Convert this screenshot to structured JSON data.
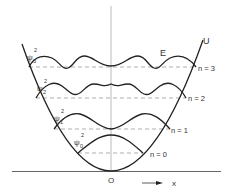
{
  "diagram": {
    "title": "",
    "labels": {
      "energy": "E",
      "potential": "U",
      "origin": "O",
      "x_axis": "x"
    },
    "levels": [
      {
        "n_label": "n = 0",
        "psi_label": "ψ",
        "psi_sup": "2",
        "psi_sub": "0"
      },
      {
        "n_label": "n = 1",
        "psi_label": "ψ",
        "psi_sup": "2",
        "psi_sub": "1"
      },
      {
        "n_label": "n = 2",
        "psi_label": "ψ",
        "psi_sup": "2",
        "psi_sub": "2"
      },
      {
        "n_label": "n = 3",
        "psi_label": "ψ",
        "psi_sup": "2",
        "psi_sub": "3"
      }
    ],
    "colors": {
      "line": "#222222",
      "dashed": "#9a9a9a",
      "text": "#333333"
    }
  }
}
